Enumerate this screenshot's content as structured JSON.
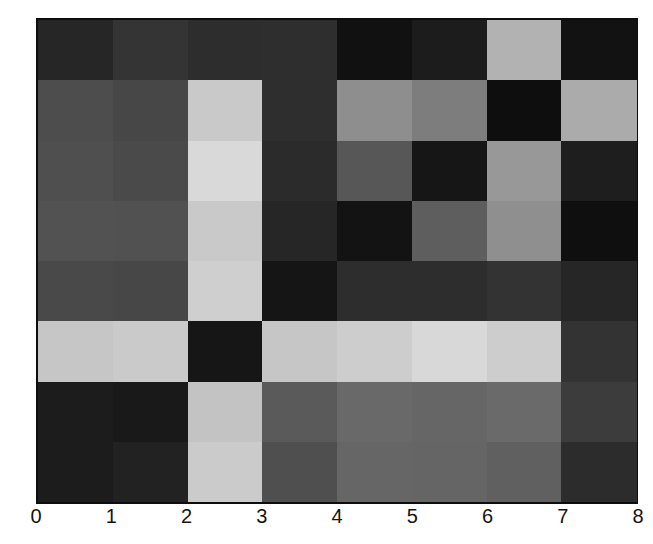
{
  "figure": {
    "background_color": "#ffffff",
    "frame_color": "#0d0d0d",
    "tick_label_color": "#141414"
  },
  "chart_data": {
    "type": "heatmap",
    "title": "",
    "xlabel": "",
    "ylabel": "",
    "colormap": "gray",
    "x_range": [
      0,
      8
    ],
    "y_range": [
      0,
      8
    ],
    "grid": false,
    "legend": "none",
    "x_ticks": [
      "0",
      "1",
      "2",
      "3",
      "4",
      "5",
      "6",
      "7",
      "8"
    ],
    "y_ticks": [
      "0",
      "1",
      "2",
      "3",
      "4",
      "5",
      "6",
      "7",
      "8"
    ],
    "rows_order": "top_to_bottom, first row spans y=7..8, last row spans y=0..1; columns left_to_right x=0..8",
    "values_0_to_1": [
      [
        0.15,
        0.2,
        0.18,
        0.18,
        0.07,
        0.11,
        0.7,
        0.07
      ],
      [
        0.3,
        0.28,
        0.79,
        0.18,
        0.56,
        0.49,
        0.05,
        0.67
      ],
      [
        0.31,
        0.29,
        0.85,
        0.17,
        0.34,
        0.09,
        0.6,
        0.12
      ],
      [
        0.32,
        0.32,
        0.79,
        0.15,
        0.07,
        0.37,
        0.56,
        0.06
      ],
      [
        0.29,
        0.28,
        0.81,
        0.08,
        0.18,
        0.18,
        0.2,
        0.15
      ],
      [
        0.78,
        0.79,
        0.09,
        0.78,
        0.8,
        0.85,
        0.8,
        0.2
      ],
      [
        0.11,
        0.1,
        0.76,
        0.35,
        0.41,
        0.4,
        0.42,
        0.24
      ],
      [
        0.11,
        0.13,
        0.8,
        0.31,
        0.4,
        0.4,
        0.38,
        0.17
      ]
    ],
    "cell_colors": [
      [
        "#262626",
        "#343434",
        "#2d2d2d",
        "#2e2e2e",
        "#111111",
        "#1c1c1c",
        "#b2b2b2",
        "#121212"
      ],
      [
        "#4d4d4d",
        "#474747",
        "#c9c9c9",
        "#2e2e2e",
        "#8e8e8e",
        "#7d7d7d",
        "#0e0e0e",
        "#ababab"
      ],
      [
        "#4f4f4f",
        "#4a4a4a",
        "#d9d9d9",
        "#2b2b2b",
        "#575757",
        "#161616",
        "#989898",
        "#1e1e1e"
      ],
      [
        "#525252",
        "#515151",
        "#c9c9c9",
        "#262626",
        "#131313",
        "#5e5e5e",
        "#8f8f8f",
        "#0f0f0f"
      ],
      [
        "#494949",
        "#474747",
        "#cfcfcf",
        "#151515",
        "#2d2d2d",
        "#2d2d2d",
        "#333333",
        "#262626"
      ],
      [
        "#c6c6c6",
        "#cacaca",
        "#161616",
        "#c6c6c6",
        "#cdcdcd",
        "#d8d8d8",
        "#cdcdcd",
        "#333333"
      ],
      [
        "#1c1c1c",
        "#191919",
        "#c3c3c3",
        "#5a5a5a",
        "#696969",
        "#666666",
        "#6a6a6a",
        "#3c3c3c"
      ],
      [
        "#1c1c1c",
        "#222222",
        "#cbcbcb",
        "#4f4f4f",
        "#666666",
        "#656565",
        "#606060",
        "#2c2c2c"
      ]
    ]
  }
}
